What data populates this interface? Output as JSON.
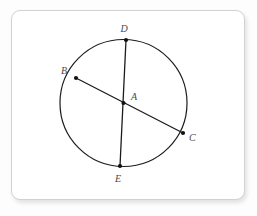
{
  "figure": {
    "kind": "circle-with-two-chords-diagram",
    "background_color": "#fdfdfd",
    "card": {
      "background_color": "#ffffff",
      "border_color": "#d2d2d2",
      "corner_radius_px": 9,
      "x": 11,
      "y": 10,
      "width": 234,
      "height": 190
    },
    "circle": {
      "center_x": 123.5,
      "center_y": 103,
      "radius": 63.5,
      "stroke_color": "#1c1c1c",
      "stroke_width": 1.2,
      "fill": "none"
    },
    "stroke_color": "#1c1c1c",
    "point_color": "#111111",
    "label_color": "#4a4a4a",
    "points": [
      {
        "id": "A",
        "label": "A",
        "x": 123.5,
        "y": 103,
        "label_x": 131,
        "label_y": 100,
        "role": "center",
        "dot": true
      },
      {
        "id": "B",
        "label": "B",
        "x": 76,
        "y": 78,
        "label_x": 64,
        "label_y": 74,
        "role": "on-circle",
        "dot": true
      },
      {
        "id": "C",
        "label": "C",
        "x": 183,
        "y": 133,
        "label_x": 189,
        "label_y": 141,
        "role": "on-circle",
        "dot": true
      },
      {
        "id": "D",
        "label": "D",
        "x": 126,
        "y": 40,
        "label_x": 124,
        "label_y": 32,
        "role": "on-circle",
        "dot": true
      },
      {
        "id": "E",
        "label": "E",
        "x": 120,
        "y": 166,
        "label_x": 118,
        "label_y": 182,
        "role": "on-circle",
        "dot": true
      }
    ],
    "chords": [
      {
        "id": "DE",
        "from": "D",
        "to": "E",
        "x1": 126,
        "y1": 40,
        "x2": 120,
        "y2": 166,
        "type": "diameter"
      },
      {
        "id": "BC",
        "from": "B",
        "to": "C",
        "x1": 76,
        "y1": 78,
        "x2": 183,
        "y2": 133,
        "type": "diameter"
      }
    ]
  }
}
